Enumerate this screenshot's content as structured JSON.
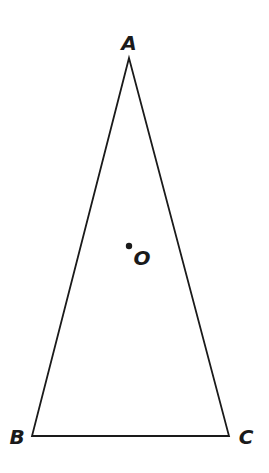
{
  "diagram": {
    "type": "geometry",
    "shape": "triangle",
    "stroke_color": "#1a1a1a",
    "vertices": [
      {
        "name": "A",
        "x": 129,
        "y": 58,
        "label_x": 129,
        "label_y": 50
      },
      {
        "name": "B",
        "x": 32,
        "y": 436,
        "label_x": 17,
        "label_y": 444
      },
      {
        "name": "C",
        "x": 229,
        "y": 436,
        "label_x": 246,
        "label_y": 444
      }
    ],
    "points": [
      {
        "name": "O",
        "x": 129,
        "y": 246,
        "label_x": 142,
        "label_y": 265
      }
    ]
  }
}
